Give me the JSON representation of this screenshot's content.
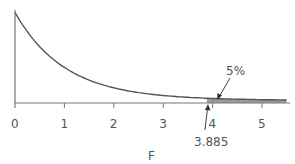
{
  "chart_data": {
    "type": "line",
    "title": "",
    "xlabel": "F",
    "ylabel": "",
    "xlim": [
      0,
      5.5
    ],
    "xticks": [
      "0",
      "1",
      "2",
      "3",
      "4",
      "5"
    ],
    "grid": false,
    "legend": null,
    "series": [
      {
        "name": "F distribution density",
        "x": [
          0,
          0.5,
          1,
          1.5,
          2,
          2.5,
          3,
          3.5,
          4,
          4.5,
          5,
          5.5
        ],
        "values": [
          1.0,
          0.6,
          0.37,
          0.23,
          0.14,
          0.09,
          0.06,
          0.04,
          0.03,
          0.02,
          0.015,
          0.01
        ]
      }
    ],
    "annotations": [
      {
        "text": "5%",
        "points_to": "shaded right-tail area beyond F = 3.885"
      },
      {
        "text": "3.885",
        "x": 3.885,
        "points_to": "critical value on F axis"
      }
    ]
  },
  "colors": {
    "curve": "#555555",
    "axis": "#777777",
    "tail_shade": "#999999",
    "text": "#555555"
  }
}
